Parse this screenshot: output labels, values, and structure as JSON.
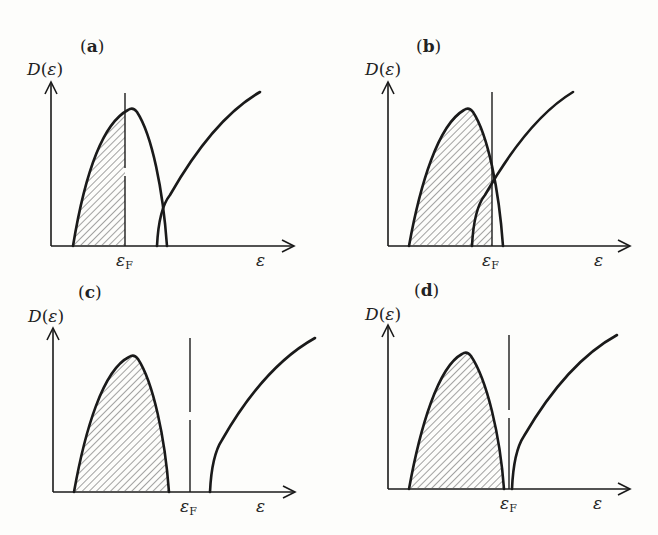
{
  "figure": {
    "y_axis_label": {
      "func": "D",
      "open": "(",
      "var": "ε",
      "close": ")"
    },
    "x_axis_label": "ε",
    "fermi_label": {
      "main": "ε",
      "sub": "F"
    },
    "hatch_color": "#555555",
    "line_color": "#1a1a1a",
    "background": "#fdfdfb"
  },
  "panels": [
    {
      "id": "a",
      "label_open": "(",
      "label": "a",
      "label_close": ")",
      "case": "Fermi level inside lower band; bands overlap (metal)"
    },
    {
      "id": "b",
      "label_open": "(",
      "label": "b",
      "label_close": ")",
      "case": "Overlapping bands; Fermi level in overlap region (semimetal)"
    },
    {
      "id": "c",
      "label_open": "(",
      "label": "c",
      "label_close": ")",
      "case": "Filled lower band, large gap (insulator)"
    },
    {
      "id": "d",
      "label_open": "(",
      "label": "d",
      "label_close": ")",
      "case": "Filled lower band, small gap (semiconductor)"
    }
  ],
  "caption": ""
}
